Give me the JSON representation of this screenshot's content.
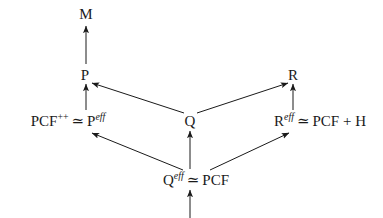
{
  "diagram": {
    "kind": "commutative-diagram",
    "background_color": "#ffffff",
    "ink_color": "#1a1a1a",
    "nodes": [
      {
        "id": "M",
        "label": "M",
        "x": 86,
        "y": 14,
        "style": "obj"
      },
      {
        "id": "P",
        "label": "P",
        "x": 85,
        "y": 75,
        "style": "obj"
      },
      {
        "id": "R",
        "label": "R",
        "x": 293,
        "y": 75,
        "style": "obj"
      },
      {
        "id": "Q",
        "label": "Q",
        "x": 190,
        "y": 121,
        "style": "obj"
      },
      {
        "id": "Peff",
        "base": "PCF",
        "base_sup": "++",
        "rel": "≃",
        "target": "P",
        "target_sup": "eff",
        "x": 68,
        "y": 121,
        "style": "expr"
      },
      {
        "id": "Reff",
        "base": "R",
        "base_sup": "eff",
        "rel": "≃",
        "target": "PCF + H",
        "target_sup": "",
        "x": 320,
        "y": 121,
        "style": "expr"
      },
      {
        "id": "Qeff",
        "base": "Q",
        "base_sup": "eff",
        "rel": "≃",
        "target": "PCF",
        "target_sup": "",
        "x": 196,
        "y": 180,
        "style": "expr"
      }
    ],
    "arrows": [
      {
        "id": "P-to-M",
        "from": "P",
        "to": "M",
        "x1": 86,
        "y1": 64,
        "x2": 86,
        "y2": 26,
        "head": "end"
      },
      {
        "id": "Peff-to-P",
        "from": "Peff",
        "to": "P",
        "x1": 86,
        "y1": 110,
        "x2": 86,
        "y2": 84,
        "head": "end"
      },
      {
        "id": "Reff-to-R",
        "from": "Reff",
        "to": "R",
        "x1": 293,
        "y1": 110,
        "x2": 293,
        "y2": 84,
        "head": "end"
      },
      {
        "id": "Q-to-P",
        "from": "Q",
        "to": "P",
        "x1": 184,
        "y1": 113,
        "x2": 92,
        "y2": 83,
        "head": "end"
      },
      {
        "id": "Q-to-R",
        "from": "Q",
        "to": "R",
        "x1": 197,
        "y1": 113,
        "x2": 288,
        "y2": 83,
        "head": "end"
      },
      {
        "id": "Qeff-to-Q",
        "from": "Qeff",
        "to": "Q",
        "x1": 190,
        "y1": 169,
        "x2": 190,
        "y2": 131,
        "head": "end"
      },
      {
        "id": "Qeff-to-Peff",
        "from": "Qeff",
        "to": "Peff",
        "x1": 183,
        "y1": 170,
        "x2": 92,
        "y2": 133,
        "head": "end"
      },
      {
        "id": "Qeff-to-Reff",
        "from": "Qeff",
        "to": "Reff",
        "x1": 210,
        "y1": 170,
        "x2": 289,
        "y2": 133,
        "head": "end"
      },
      {
        "id": "bottom-to-Qeff",
        "from": "",
        "to": "Qeff",
        "x1": 190,
        "y1": 218,
        "x2": 190,
        "y2": 190,
        "head": "end"
      }
    ]
  }
}
